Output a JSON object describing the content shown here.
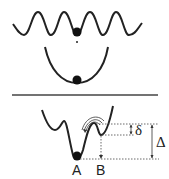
{
  "diagram": {
    "top_panel": {
      "periodic_potential": {
        "description": "sinusoidal periodic potential",
        "periods": 5
      },
      "harmonic_potential": {
        "description": "parabolic well"
      },
      "particles": 2
    },
    "bottom_panel": {
      "double_well": {
        "description": "asymmetric double-well potential"
      },
      "labels": {
        "well_a": "A",
        "well_b": "B"
      },
      "barrier_small": "δ",
      "barrier_large": "Δ"
    },
    "colors": {
      "stroke": "#222222",
      "background": "#ffffff"
    }
  }
}
